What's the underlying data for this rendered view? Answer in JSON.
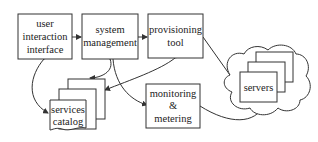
{
  "diagram": {
    "nodes": {
      "user_interface": {
        "lines": [
          "user",
          "interaction",
          "interface"
        ]
      },
      "system_management": {
        "lines": [
          "system",
          "management"
        ]
      },
      "provisioning_tool": {
        "lines": [
          "provisioning",
          "tool"
        ]
      },
      "services_catalog": {
        "lines": [
          "services",
          "catalog"
        ]
      },
      "monitoring": {
        "lines": [
          "monitoring",
          "&",
          "metering"
        ]
      },
      "servers": {
        "lines": [
          "servers"
        ]
      }
    },
    "edges": [
      {
        "from": "user_interface",
        "to": "system_management"
      },
      {
        "from": "system_management",
        "to": "provisioning_tool"
      },
      {
        "from": "user_interface",
        "to": "services_catalog",
        "bidirectional": true
      },
      {
        "from": "system_management",
        "to": "services_catalog",
        "bidirectional": true
      },
      {
        "from": "provisioning_tool",
        "to": "services_catalog",
        "bidirectional": true
      },
      {
        "from": "system_management",
        "to": "monitoring"
      },
      {
        "from": "provisioning_tool",
        "to": "servers"
      },
      {
        "from": "monitoring",
        "to": "servers"
      }
    ],
    "colors": {
      "stroke": "#333333",
      "background": "#ffffff",
      "text": "#222222"
    }
  }
}
